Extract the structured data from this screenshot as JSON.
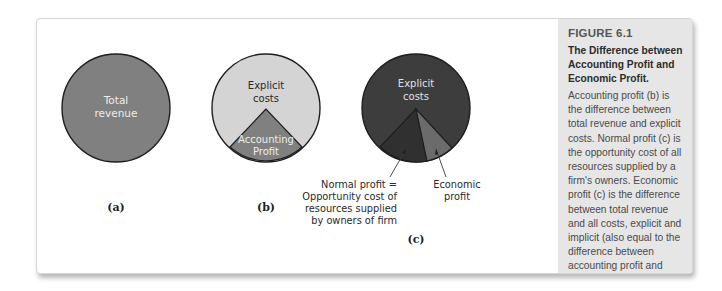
{
  "figure": {
    "number": "FIGURE 6.1",
    "title": "The Difference between Accounting Profit and Economic Profit.",
    "caption": "Accounting profit (b) is the difference between total revenue and explicit costs. Normal profit (c) is the opportunity cost of all resources supplied by a firm's owners. Economic profit (c) is the difference between total revenue and all costs, explicit and implicit (also equal to the difference between accounting profit and normal profit)."
  },
  "panels": [
    {
      "id": "a",
      "letter": "(a)",
      "pie_label_line1": "Total",
      "pie_label_line2": "revenue",
      "fill": "#808080"
    },
    {
      "id": "b",
      "letter": "(b)",
      "explicit_line1": "Explicit",
      "explicit_line2": "costs",
      "wedge_line1": "Accounting",
      "wedge_line2": "Profit",
      "fill_main": "#d4d4d4",
      "fill_wedge": "#808080"
    },
    {
      "id": "c",
      "letter": "(c)",
      "explicit_line1": "Explicit",
      "explicit_line2": "costs",
      "normal_line1": "Normal profit =",
      "normal_line2": "Opportunity cost of",
      "normal_line3": "resources supplied",
      "normal_line4": "by owners of firm",
      "economic_line1": "Economic",
      "economic_line2": "profit",
      "fill_main": "#3d3d3d",
      "fill_normal": "#333333",
      "fill_economic": "#6b6b6b"
    }
  ],
  "colors": {
    "caption_panel_bg": "#e6e6e6",
    "outline": "#1e1e1e",
    "light_text": "#ececec",
    "dark_text": "#2a2a2a"
  }
}
